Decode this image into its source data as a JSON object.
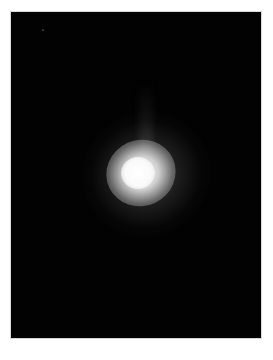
{
  "image": {
    "description": "Bright diffuse glowing blob on black background",
    "background_color": "#020202",
    "page_color": "#ffffff",
    "blob": {
      "center_x": 137,
      "center_y": 172,
      "core_radius": 16,
      "glow_radius": 60,
      "core_color": "#ffffff"
    }
  }
}
